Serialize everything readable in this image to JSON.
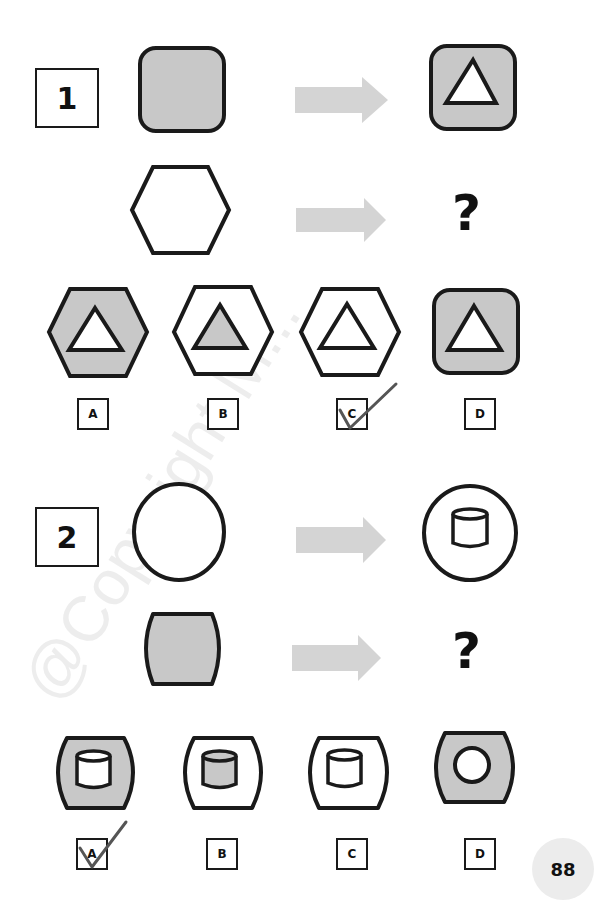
{
  "page": {
    "page_number": "88",
    "watermark": "@Copyright M...",
    "colors": {
      "stroke": "#1a1a1a",
      "fill_gray": "#c8c8c8",
      "arrow": "#d4d4d4",
      "checkmark": "#555555",
      "page_badge": "#ececec"
    }
  },
  "questions": [
    {
      "number": "1",
      "example": {
        "from": "gray-rounded-square",
        "to": "gray-rounded-square-with-white-triangle"
      },
      "prompt": {
        "from": "white-hexagon",
        "to": "?"
      },
      "options": [
        {
          "label": "A",
          "figure": "gray-hexagon-with-white-triangle",
          "checked": false
        },
        {
          "label": "B",
          "figure": "white-hexagon-with-gray-triangle",
          "checked": false
        },
        {
          "label": "C",
          "figure": "white-hexagon-with-white-triangle",
          "checked": true
        },
        {
          "label": "D",
          "figure": "gray-rounded-square-with-white-triangle",
          "checked": false
        }
      ]
    },
    {
      "number": "2",
      "example": {
        "from": "white-circle",
        "to": "white-circle-with-white-cylinder"
      },
      "prompt": {
        "from": "gray-barrel",
        "to": "?"
      },
      "options": [
        {
          "label": "A",
          "figure": "gray-barrel-with-white-cylinder",
          "checked": true
        },
        {
          "label": "B",
          "figure": "white-barrel-with-gray-cylinder",
          "checked": false
        },
        {
          "label": "C",
          "figure": "white-barrel-with-white-cylinder",
          "checked": false
        },
        {
          "label": "D",
          "figure": "gray-barrel-with-white-circle",
          "checked": false
        }
      ]
    }
  ]
}
